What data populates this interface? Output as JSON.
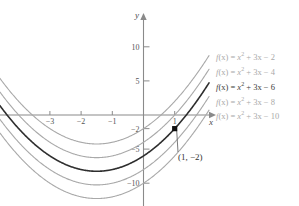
{
  "chart_data": {
    "type": "line",
    "title": "",
    "xlabel": "x",
    "ylabel": "y",
    "xlim": [
      -4.6,
      2.1
    ],
    "ylim": [
      -13.5,
      13.5
    ],
    "grid": false,
    "legend_position": "right",
    "x_ticks": [
      -3,
      -2,
      -1,
      1
    ],
    "x_tick_labels": [
      "-3",
      "-2",
      "-1",
      "1"
    ],
    "y_ticks": [
      10,
      5,
      -2,
      -5,
      -10
    ],
    "y_tick_labels": [
      "10",
      "5",
      "-2",
      "-5",
      "-10"
    ],
    "series": [
      {
        "name": "f(x) = x² + 3x − 2",
        "a": 1,
        "b": 3,
        "c": -2,
        "color": "#a9a9a9",
        "width": 1.1,
        "emphasis": false
      },
      {
        "name": "f(x) = x² + 3x − 4",
        "a": 1,
        "b": 3,
        "c": -4,
        "color": "#a9a9a9",
        "width": 1.1,
        "emphasis": false
      },
      {
        "name": "f(x) = x² + 3x − 6",
        "a": 1,
        "b": 3,
        "c": -6,
        "color": "#2e2e2e",
        "width": 1.6,
        "emphasis": true
      },
      {
        "name": "f(x) = x² + 3x − 8",
        "a": 1,
        "b": 3,
        "c": -8,
        "color": "#a9a9a9",
        "width": 1.1,
        "emphasis": false
      },
      {
        "name": "f(x) = x² + 3x − 10",
        "a": 1,
        "b": 3,
        "c": -10,
        "color": "#a9a9a9",
        "width": 1.1,
        "emphasis": false
      }
    ],
    "annotation": {
      "label": "(1, −2)",
      "x": 1,
      "y": -2
    }
  },
  "legend": {
    "entries": [
      {
        "lhs": "f",
        "arg": "(x)",
        "eq": " = ",
        "base": "x",
        "exp": "2",
        "rest": " + 3x − 2"
      },
      {
        "lhs": "f",
        "arg": "(x)",
        "eq": " = ",
        "base": "x",
        "exp": "2",
        "rest": " + 3x − 4"
      },
      {
        "lhs": "f",
        "arg": "(x)",
        "eq": " = ",
        "base": "x",
        "exp": "2",
        "rest": " + 3x − 6"
      },
      {
        "lhs": "f",
        "arg": "(x)",
        "eq": " = ",
        "base": "x",
        "exp": "2",
        "rest": " + 3x − 8"
      },
      {
        "lhs": "f",
        "arg": "(x)",
        "eq": " = ",
        "base": "x",
        "exp": "2",
        "rest": " + 3x − 10"
      }
    ]
  },
  "axes": {
    "y_axis_label": "y",
    "x_axis_label": "x"
  },
  "annotation": {
    "point_label": "(1, −2)"
  },
  "colors": {
    "background": "#ffffff",
    "axis": "#8a8a8a",
    "curve_light": "#a9a9a9",
    "curve_dark": "#2e2e2e",
    "text": "#555555"
  }
}
